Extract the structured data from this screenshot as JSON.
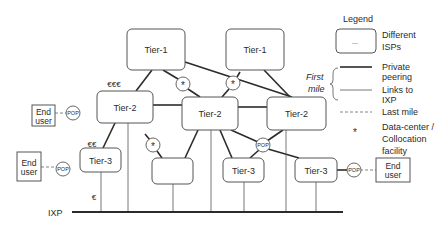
{
  "diagram": {
    "ixp_label": "IXP",
    "nodes": [
      {
        "id": "tier1-left",
        "label": "Tier-1",
        "x": 127,
        "y": 29,
        "w": 58,
        "h": 41
      },
      {
        "id": "tier1-right",
        "label": "Tier-1",
        "x": 226,
        "y": 29,
        "w": 58,
        "h": 41
      },
      {
        "id": "tier2-left",
        "label": "Tier-2",
        "x": 97,
        "y": 91,
        "w": 56,
        "h": 32
      },
      {
        "id": "tier2-middle",
        "label": "Tier-2",
        "x": 182,
        "y": 97,
        "w": 56,
        "h": 33
      },
      {
        "id": "tier2-right",
        "label": "Tier-2",
        "x": 267,
        "y": 97,
        "w": 59,
        "h": 33
      },
      {
        "id": "tier3-left",
        "label": "Tier-3",
        "x": 80,
        "y": 148,
        "w": 41,
        "h": 24
      },
      {
        "id": "unlabeled-isp",
        "label": "",
        "x": 152,
        "y": 158,
        "w": 41,
        "h": 26
      },
      {
        "id": "tier3-middle",
        "label": "Tier-3",
        "x": 223,
        "y": 158,
        "w": 41,
        "h": 24
      },
      {
        "id": "tier3-right",
        "label": "Tier-3",
        "x": 295,
        "y": 158,
        "w": 42,
        "h": 24
      }
    ],
    "end_users": [
      {
        "id": "end-user-top-left",
        "line1": "End",
        "line2": "user",
        "x": 32,
        "y": 105,
        "w": 23,
        "h": 21
      },
      {
        "id": "end-user-bottom-left",
        "line1": "End",
        "line2": "user",
        "x": 17,
        "y": 152,
        "w": 24,
        "h": 29
      },
      {
        "id": "end-user-right",
        "line1": "End",
        "line2": "user",
        "x": 376,
        "y": 158,
        "w": 34,
        "h": 24
      }
    ],
    "pops": [
      {
        "id": "pop-top-left",
        "label": "POP",
        "cx": 73,
        "cy": 113
      },
      {
        "id": "pop-bottom-left",
        "label": "POP",
        "cx": 63,
        "cy": 169
      },
      {
        "id": "pop-middle",
        "label": "POP",
        "cx": 263,
        "cy": 145
      },
      {
        "id": "pop-right",
        "label": "POP",
        "cx": 354,
        "cy": 170
      }
    ],
    "datacenters": [
      {
        "id": "dc-top-left",
        "label": "*",
        "cx": 183,
        "cy": 84
      },
      {
        "id": "dc-top-right",
        "label": "*",
        "cx": 233,
        "cy": 83
      },
      {
        "id": "dc-lower-left",
        "label": "*",
        "cx": 153,
        "cy": 145
      }
    ],
    "cost_labels": [
      {
        "id": "cost-tier1-tier2",
        "text": "€€€",
        "x": 114,
        "y": 87
      },
      {
        "id": "cost-tier2-tier3",
        "text": "€€",
        "x": 92,
        "y": 147
      },
      {
        "id": "cost-tier3-ixp",
        "text": "€",
        "x": 94,
        "y": 200
      }
    ],
    "private_peering_links": [
      [
        152,
        70,
        136,
        91
      ],
      [
        163,
        70,
        178,
        79
      ],
      [
        188,
        89,
        200,
        97
      ],
      [
        185,
        62,
        292,
        97
      ],
      [
        240,
        72,
        237,
        77
      ],
      [
        229,
        89,
        222,
        97
      ],
      [
        264,
        70,
        290,
        97
      ],
      [
        153,
        105,
        182,
        105
      ],
      [
        238,
        107,
        267,
        107
      ],
      [
        115,
        123,
        103,
        148
      ],
      [
        145,
        134,
        150,
        140
      ],
      [
        157,
        151,
        162,
        158
      ],
      [
        198,
        130,
        185,
        158
      ],
      [
        220,
        130,
        232,
        158
      ],
      [
        231,
        130,
        258,
        142
      ],
      [
        268,
        149,
        299,
        158
      ],
      [
        259,
        150,
        250,
        158
      ],
      [
        283,
        130,
        267,
        141
      ],
      [
        121,
        160,
        80,
        160
      ],
      [
        337,
        170,
        348,
        170
      ],
      [
        153,
        113,
        97,
        113
      ]
    ],
    "ixp_links": [
      [
        101,
        172,
        101,
        212
      ],
      [
        128,
        123,
        128,
        212
      ],
      [
        173,
        184,
        173,
        212
      ],
      [
        211,
        130,
        211,
        212
      ],
      [
        244,
        182,
        244,
        212
      ],
      [
        286,
        130,
        286,
        212
      ],
      [
        316,
        182,
        316,
        212
      ]
    ],
    "last_mile_links": [
      [
        55,
        113,
        67,
        113
      ],
      [
        41,
        167,
        57,
        167
      ],
      [
        360,
        170,
        376,
        170
      ]
    ],
    "ixp_line": [
      72,
      212,
      343,
      212
    ]
  },
  "legend": {
    "title": "Legend",
    "isp_box_symbol": "...",
    "isp_label_1": "Different",
    "isp_label_2": "ISPs",
    "first_mile_1": "First",
    "first_mile_2": "mile",
    "private_label_1": "Private",
    "private_label_2": "peering",
    "ixp_label_1": "Links to",
    "ixp_label_2": "IXP",
    "last_mile_label": "Last mile",
    "dc_symbol": "*",
    "dc_label_1": "Data-center /",
    "dc_label_2": "Collocation",
    "dc_label_3": "facility"
  }
}
